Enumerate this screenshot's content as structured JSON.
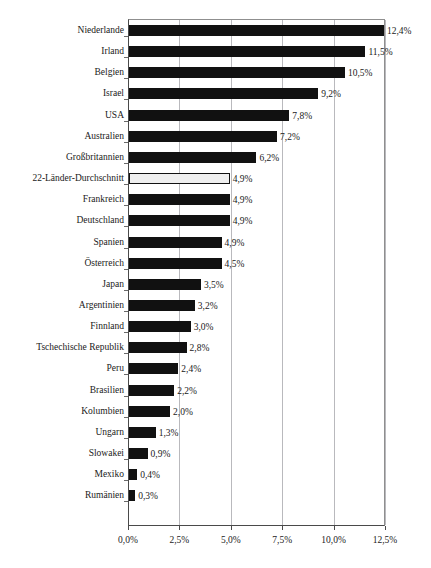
{
  "chart_data": {
    "type": "bar",
    "orientation": "horizontal",
    "title": "",
    "xlabel": "",
    "ylabel": "",
    "xlim": [
      0,
      12.5
    ],
    "grid": true,
    "legend": "none",
    "value_suffix": "%",
    "decimal_separator": ",",
    "xticks": [
      "0,0%",
      "2,5%",
      "5,0%",
      "7,5%",
      "10,0%",
      "12,5%"
    ],
    "xtick_values": [
      0,
      2.5,
      5.0,
      7.5,
      10.0,
      12.5
    ],
    "categories": [
      "Niederlande",
      "Irland",
      "Belgien",
      "Israel",
      "USA",
      "Australien",
      "Großbritannien",
      "22-Länder-Durchschnitt",
      "Frankreich",
      "Deutschland",
      "Spanien",
      "Österreich",
      "Japan",
      "Argentinien",
      "Finnland",
      "Tschechische Republik",
      "Peru",
      "Brasilien",
      "Kolumbien",
      "Ungarn",
      "Slowakei",
      "Mexiko",
      "Rumänien"
    ],
    "values": [
      12.4,
      11.5,
      10.5,
      9.2,
      7.8,
      7.2,
      6.2,
      4.9,
      4.9,
      4.9,
      4.5,
      4.5,
      3.5,
      3.2,
      3.0,
      2.8,
      2.4,
      2.2,
      2.0,
      1.3,
      0.9,
      0.4,
      0.3
    ],
    "value_labels": [
      "12,4%",
      "11,5%",
      "10,5%",
      "9,2%",
      "7,8%",
      "7,2%",
      "6,2%",
      "4,9%",
      "4,9%",
      "4,9%",
      "4,9%",
      "4,5%",
      "3,5%",
      "3,2%",
      "3,0%",
      "2,8%",
      "2,4%",
      "2,2%",
      "2,0%",
      "1,3%",
      "0,9%",
      "0,4%",
      "0,3%"
    ],
    "highlight_index": 7,
    "highlight_style": "white-fill-black-outline",
    "bar_color": "#111111",
    "highlight_color": "#efefef",
    "gridline_color": "#b9b9bd",
    "axis_color": "#4a4a4a"
  }
}
